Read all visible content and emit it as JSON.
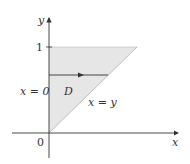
{
  "diagram": {
    "axes": {
      "x_label": "x",
      "y_label": "y"
    },
    "ticks": {
      "origin": "0",
      "y_one": "1"
    },
    "region": {
      "label": "D",
      "fill": "#e6e6e6"
    },
    "boundaries": {
      "left": "x = 0",
      "diagonal": "x = y"
    },
    "colors": {
      "axis": "#333333",
      "region": "#e6e6e6",
      "arrow": "#333333"
    }
  }
}
